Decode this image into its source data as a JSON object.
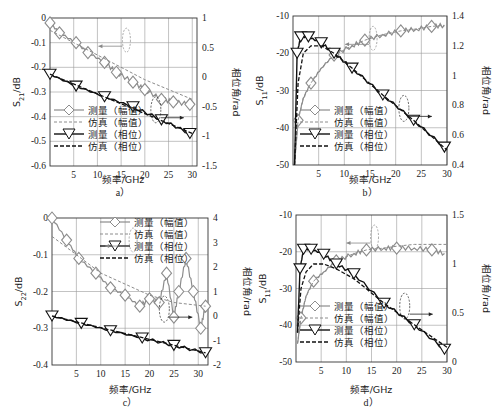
{
  "legend": {
    "meas_mag": "测量（幅值）",
    "sim_mag": "仿真（幅值）",
    "meas_phase": "测量（相位）",
    "sim_phase": "仿真（相位）"
  },
  "colors": {
    "magnitude": "#8c8c8c",
    "phase": "#111111",
    "grid": "#9a9a9a"
  },
  "chart_data": [
    {
      "id": "a",
      "type": "line",
      "caption": "a）",
      "xlabel": "频率/GHz",
      "ylabel": "S21/dB",
      "ylabel_main": "S",
      "ylabel_sub": "21",
      "ylabel_unit": "/dB",
      "y2label": "相位角/rad",
      "xlim": [
        0,
        31
      ],
      "xticks": [
        5,
        10,
        15,
        20,
        25,
        30
      ],
      "ylim": [
        -0.6,
        0
      ],
      "yticks": [
        "0",
        "-0.1",
        "-0.2",
        "-0.3",
        "-0.4",
        "-0.5",
        "-0.6"
      ],
      "y2lim": [
        -1.5,
        1
      ],
      "y2ticks": [
        "1",
        "0.5",
        "0",
        "-0.5",
        "-1",
        "-1.5"
      ],
      "grid": true,
      "legend_position": "lower left",
      "series": [
        {
          "name": "测量（幅值）",
          "axis": "left",
          "x": [
            0,
            2,
            5.5,
            8,
            11.5,
            14,
            17.5,
            20,
            23.5,
            26,
            29.5
          ],
          "y": [
            -0.02,
            -0.06,
            -0.1,
            -0.14,
            -0.18,
            -0.22,
            -0.26,
            -0.29,
            -0.33,
            -0.34,
            -0.35
          ]
        },
        {
          "name": "仿真（幅值）",
          "axis": "left",
          "x": [
            0,
            5,
            10,
            15,
            20,
            25,
            30
          ],
          "y": [
            -0.05,
            -0.1,
            -0.15,
            -0.2,
            -0.25,
            -0.29,
            -0.33
          ]
        },
        {
          "name": "测量（相位）",
          "axis": "right",
          "x": [
            0,
            5.5,
            11.5,
            17.5,
            23.5,
            29.5
          ],
          "y": [
            0.05,
            -0.15,
            -0.33,
            -0.5,
            -0.72,
            -0.95
          ]
        },
        {
          "name": "仿真（相位）",
          "axis": "right",
          "x": [
            0,
            30
          ],
          "y": [
            0.05,
            -0.95
          ]
        }
      ]
    },
    {
      "id": "b",
      "type": "line",
      "caption": "b）",
      "xlabel": "频率/GHz",
      "ylabel": "S11/dB",
      "ylabel_main": "S",
      "ylabel_sub": "11",
      "ylabel_unit": "/dB",
      "y2label": "相位角/rad",
      "xlim": [
        0,
        30
      ],
      "xticks": [
        5,
        10,
        15,
        20,
        25,
        30
      ],
      "ylim": [
        -50,
        -10
      ],
      "yticks": [
        "-10",
        "-20",
        "-30",
        "-40",
        "-50"
      ],
      "y2lim": [
        0.4,
        1.4
      ],
      "y2ticks": [
        "1.4",
        "1.2",
        "1",
        "0.8",
        "0.6",
        "0.4"
      ],
      "grid": true,
      "legend_position": "lower left",
      "series": [
        {
          "name": "测量（幅值）",
          "axis": "left",
          "x": [
            0.3,
            1,
            2,
            3.5,
            5.5,
            8,
            11.5,
            14,
            17.5,
            21,
            24,
            27,
            29.5
          ],
          "y": [
            -50,
            -38,
            -32,
            -28,
            -24,
            -20.5,
            -18,
            -16.5,
            -15,
            -14,
            -13.5,
            -12.8,
            -12.5
          ]
        },
        {
          "name": "仿真（幅值）",
          "axis": "left",
          "x": [
            0.3,
            1,
            2,
            3.5,
            5.5,
            8,
            11.5,
            14,
            17.5,
            21,
            24,
            27,
            29.5
          ],
          "y": [
            -50,
            -38,
            -32,
            -28,
            -24,
            -20.5,
            -18,
            -16.5,
            -15,
            -14,
            -13.5,
            -12.8,
            -12.5
          ]
        },
        {
          "name": "测量（相位）",
          "axis": "right",
          "x": [
            0.3,
            0.8,
            1.5,
            3,
            5.5,
            8,
            11.5,
            17.5,
            23.5,
            29.5
          ],
          "y": [
            0.4,
            1.15,
            1.26,
            1.26,
            1.22,
            1.15,
            1.05,
            0.87,
            0.7,
            0.52
          ]
        },
        {
          "name": "仿真（相位）",
          "axis": "right",
          "x": [
            0.3,
            1,
            2,
            3.5,
            5.5,
            8,
            11.5,
            17.5,
            23.5,
            30
          ],
          "y": [
            0.4,
            0.95,
            1.15,
            1.2,
            1.2,
            1.15,
            1.05,
            0.87,
            0.7,
            0.5
          ]
        }
      ]
    },
    {
      "id": "c",
      "type": "line",
      "caption": "c）",
      "xlabel": "频率/GHz",
      "ylabel": "S22/dB",
      "ylabel_main": "S",
      "ylabel_sub": "22",
      "ylabel_unit": "/dB",
      "y2label": "相位角/rad",
      "xlim": [
        0,
        32
      ],
      "xticks": [
        5,
        10,
        15,
        20,
        25,
        30
      ],
      "ylim": [
        -0.4,
        0
      ],
      "yticks": [
        "0",
        "-0.1",
        "-0.2",
        "-0.3",
        "-0.4"
      ],
      "y2lim": [
        -2,
        4
      ],
      "y2ticks": [
        "4",
        "3",
        "2",
        "1",
        "0",
        "-1",
        "-2"
      ],
      "grid": true,
      "legend_position": "upper right",
      "series": [
        {
          "name": "测量（幅值）",
          "axis": "left",
          "x": [
            0,
            3,
            5.5,
            9,
            12,
            15,
            18,
            20,
            22,
            23.5,
            25,
            26,
            27.5,
            29,
            30.5,
            31.5
          ],
          "y": [
            0,
            -0.06,
            -0.11,
            -0.15,
            -0.19,
            -0.21,
            -0.24,
            -0.22,
            -0.23,
            -0.15,
            -0.27,
            -0.2,
            -0.11,
            -0.2,
            -0.3,
            -0.24
          ]
        },
        {
          "name": "仿真（幅值）",
          "axis": "left",
          "x": [
            0,
            3,
            6,
            10,
            15,
            20,
            25,
            31.5
          ],
          "y": [
            -0.05,
            -0.08,
            -0.11,
            -0.15,
            -0.18,
            -0.21,
            -0.23,
            -0.24
          ]
        },
        {
          "name": "测量（相位）",
          "axis": "right",
          "x": [
            0,
            6,
            12,
            18.5,
            25,
            31.5
          ],
          "y": [
            0,
            -0.3,
            -0.6,
            -0.9,
            -1.2,
            -1.5
          ]
        },
        {
          "name": "仿真（相位）",
          "axis": "right",
          "x": [
            0,
            31.5
          ],
          "y": [
            0,
            -1.5
          ]
        }
      ]
    },
    {
      "id": "d",
      "type": "line",
      "caption": "d）",
      "xlabel": "频率/GHz",
      "ylabel": "S11/dB",
      "ylabel_main": "S",
      "ylabel_sub": "11",
      "ylabel_unit": "/dB",
      "y2label": "相位角/rad",
      "xlim": [
        0,
        30
      ],
      "xticks": [
        5,
        10,
        15,
        20,
        25,
        30
      ],
      "ylim": [
        -50,
        -10
      ],
      "yticks": [
        "-10",
        "-20",
        "-30",
        "-40",
        "-50"
      ],
      "y2lim": [
        0,
        1.5
      ],
      "y2ticks": [
        "1.5",
        "1",
        "0.5",
        "0"
      ],
      "grid": true,
      "legend_position": "lower left",
      "series": [
        {
          "name": "测量（幅值）",
          "axis": "left",
          "x": [
            0.3,
            1,
            2,
            3.5,
            5.5,
            8,
            11.5,
            14,
            17.5,
            20,
            23.5,
            27,
            29.5
          ],
          "y": [
            -45,
            -38,
            -32,
            -28,
            -25.5,
            -22.5,
            -20.5,
            -19.5,
            -19,
            -19,
            -19,
            -19.5,
            -20.5
          ]
        },
        {
          "name": "仿真（幅值）",
          "axis": "left",
          "x": [
            0.3,
            1,
            2,
            3.5,
            5.5,
            8,
            11.5,
            14,
            17.5,
            20,
            23.5,
            27,
            30
          ],
          "y": [
            -45,
            -38,
            -32,
            -28,
            -25.5,
            -22.5,
            -20.5,
            -19.5,
            -19,
            -18.5,
            -18,
            -18,
            -18
          ]
        },
        {
          "name": "测量（相位）",
          "axis": "right",
          "x": [
            0.3,
            0.8,
            1.5,
            3,
            5.5,
            8,
            11.5,
            17.5,
            23.5,
            29.5
          ],
          "y": [
            0.3,
            0.95,
            1.15,
            1.15,
            1.1,
            1.0,
            0.9,
            0.6,
            0.38,
            0.13
          ]
        },
        {
          "name": "仿真（相位）",
          "axis": "right",
          "x": [
            0.3,
            1,
            2,
            3.5,
            5.5,
            8,
            11.5,
            17.5,
            23.5,
            30
          ],
          "y": [
            0.3,
            0.75,
            0.92,
            1.0,
            1.0,
            0.95,
            0.85,
            0.6,
            0.38,
            0.15
          ]
        }
      ]
    }
  ]
}
